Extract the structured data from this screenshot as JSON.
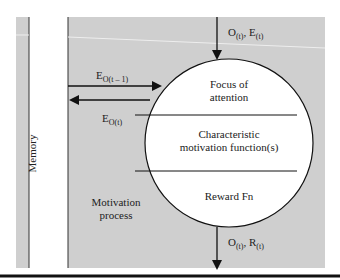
{
  "diagram": {
    "memory_label": "Memory",
    "process_label_line1": "Motivation",
    "process_label_line2": "process",
    "sections": [
      {
        "line1": "Focus of",
        "line2": "attention"
      },
      {
        "line1": "Characteristic",
        "line2": "motivation function(s)"
      },
      {
        "line1": "Reward Fn",
        "line2": ""
      }
    ],
    "input_arrow": {
      "a": "O",
      "a_sub": "(t)",
      "b": "E",
      "b_sub": "(t)"
    },
    "output_arrow": {
      "a": "O",
      "a_sub": "(t)",
      "b": "R",
      "b_sub": "(t)"
    },
    "to_memory_arrow": {
      "a": "E",
      "a_sub": "O(t – 1)"
    },
    "from_memory_arrow": {
      "a": "E",
      "a_sub": "O(t)"
    },
    "colors": {
      "panel": "#cfcfcf",
      "circle": "#ffffff",
      "stroke": "#111111"
    }
  }
}
